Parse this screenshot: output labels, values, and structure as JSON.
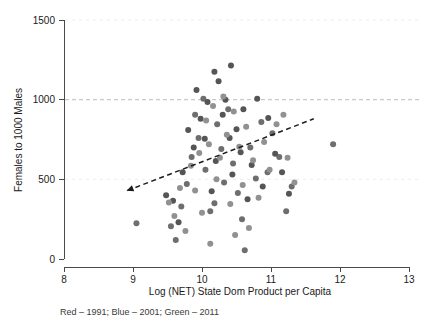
{
  "chart_data": {
    "type": "scatter",
    "title": "",
    "xlabel": "Log (NET) State Dom Product per Capita",
    "ylabel": "Females to 1000 Males",
    "xlim": [
      8,
      13
    ],
    "ylim": [
      0,
      1500
    ],
    "xticks": [
      8,
      9,
      10,
      11,
      12,
      13
    ],
    "yticks": [
      0,
      500,
      1000,
      1500
    ],
    "xtick_labels": [
      "8",
      "9",
      "10",
      "11",
      "12",
      "13"
    ],
    "ytick_labels": [
      "0",
      "500",
      "1000",
      "1500"
    ],
    "grid": "horizontal dashed gridlines at 500, 1000, 1500; emphasized at 1000",
    "legend_position": "below-plot-caption",
    "caption": "Red – 1991; Blue – 2001; Green – 2011",
    "legend_entries": [
      {
        "label": "Red – 1991",
        "year": 1991,
        "color": "#d93b3b"
      },
      {
        "label": "Blue – 2001",
        "year": 2001,
        "color": "#3b5fd9"
      },
      {
        "label": "Green – 2011",
        "year": 2011,
        "color": "#3b9d4f"
      }
    ],
    "note": "Screenshot is rendered in grayscale; point fills appear as gray tones rather than the red/blue/green stated in the caption.",
    "annotations": [
      {
        "type": "trend-line",
        "style": "dashed with arrowhead at left end",
        "x_start": 8.92,
        "y_start": 430,
        "x_end": 11.62,
        "y_end": 880
      }
    ],
    "series": [
      {
        "name": "Red – 1991",
        "color": "#6e6e6e",
        "points": [
          [
            9.05,
            225
          ],
          [
            9.55,
            205
          ],
          [
            9.62,
            120
          ],
          [
            9.7,
            330
          ],
          [
            9.78,
            470
          ],
          [
            9.85,
            640
          ],
          [
            9.9,
            905
          ],
          [
            9.95,
            760
          ],
          [
            10.02,
            1005
          ],
          [
            10.05,
            560
          ],
          [
            10.12,
            300
          ],
          [
            10.18,
            350
          ],
          [
            10.22,
            845
          ],
          [
            10.28,
            690
          ],
          [
            10.32,
            480
          ],
          [
            10.38,
            940
          ],
          [
            10.45,
            600
          ],
          [
            10.52,
            415
          ],
          [
            10.58,
            250
          ],
          [
            10.62,
            55
          ],
          [
            10.7,
            700
          ],
          [
            10.78,
            505
          ],
          [
            10.86,
            860
          ],
          [
            10.95,
            545
          ],
          [
            11.02,
            790
          ],
          [
            11.12,
            640
          ],
          [
            11.22,
            300
          ],
          [
            11.3,
            455
          ],
          [
            11.9,
            720
          ]
        ]
      },
      {
        "name": "Blue – 2001",
        "color": "#555555",
        "points": [
          [
            9.48,
            400
          ],
          [
            9.58,
            365
          ],
          [
            9.66,
            230
          ],
          [
            9.72,
            545
          ],
          [
            9.8,
            810
          ],
          [
            9.88,
            700
          ],
          [
            9.92,
            1060
          ],
          [
            9.98,
            880
          ],
          [
            10.04,
            755
          ],
          [
            10.08,
            985
          ],
          [
            10.14,
            425
          ],
          [
            10.2,
            615
          ],
          [
            10.24,
            1115
          ],
          [
            10.3,
            905
          ],
          [
            10.34,
            1000
          ],
          [
            10.4,
            760
          ],
          [
            10.44,
            530
          ],
          [
            10.5,
            815
          ],
          [
            10.56,
            670
          ],
          [
            10.6,
            940
          ],
          [
            10.66,
            375
          ],
          [
            10.72,
            590
          ],
          [
            10.8,
            1005
          ],
          [
            10.88,
            455
          ],
          [
            10.96,
            885
          ],
          [
            11.06,
            660
          ],
          [
            11.16,
            545
          ],
          [
            11.26,
            410
          ],
          [
            10.42,
            1215
          ],
          [
            10.18,
            1175
          ]
        ]
      },
      {
        "name": "Green – 2011",
        "color": "#919191",
        "points": [
          [
            9.52,
            355
          ],
          [
            9.6,
            270
          ],
          [
            9.68,
            445
          ],
          [
            9.76,
            175
          ],
          [
            9.84,
            585
          ],
          [
            9.9,
            430
          ],
          [
            9.96,
            665
          ],
          [
            10.0,
            290
          ],
          [
            10.06,
            870
          ],
          [
            10.1,
            720
          ],
          [
            10.16,
            960
          ],
          [
            10.21,
            500
          ],
          [
            10.26,
            635
          ],
          [
            10.31,
            1020
          ],
          [
            10.36,
            780
          ],
          [
            10.41,
            345
          ],
          [
            10.46,
            925
          ],
          [
            10.54,
            705
          ],
          [
            10.59,
            465
          ],
          [
            10.64,
            830
          ],
          [
            10.68,
            195
          ],
          [
            10.74,
            620
          ],
          [
            10.82,
            385
          ],
          [
            10.9,
            735
          ],
          [
            10.98,
            560
          ],
          [
            11.08,
            845
          ],
          [
            11.18,
            905
          ],
          [
            11.24,
            635
          ],
          [
            11.34,
            480
          ],
          [
            10.48,
            150
          ],
          [
            10.12,
            95
          ]
        ]
      }
    ]
  }
}
